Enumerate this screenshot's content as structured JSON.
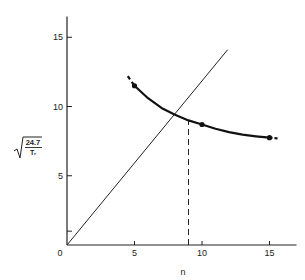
{
  "chart_data": {
    "type": "line",
    "title": "",
    "xlabel": "n",
    "ylabel": "sqrt(24.7 / T_r)",
    "ylabel_parts": {
      "numerator": "24.7",
      "denominator": "Tᵣ"
    },
    "xlim": [
      0,
      17
    ],
    "ylim": [
      0,
      16.5
    ],
    "x_ticks": [
      {
        "value": 0,
        "label": "0"
      },
      {
        "value": 5,
        "label": "5"
      },
      {
        "value": 10,
        "label": "10"
      },
      {
        "value": 15,
        "label": "15"
      }
    ],
    "y_ticks": [
      {
        "value": 1,
        "label": ""
      },
      {
        "value": 5,
        "label": "5"
      },
      {
        "value": 10,
        "label": "10"
      },
      {
        "value": 15,
        "label": "15"
      }
    ],
    "grid": false,
    "legend": null,
    "series": [
      {
        "name": "sqrt(24.7/T_r) curve",
        "style": "thick solid, dashed extensions at ends",
        "markers": true,
        "points": [
          {
            "x": 5,
            "y": 11.5
          },
          {
            "x": 10,
            "y": 8.7
          },
          {
            "x": 15,
            "y": 7.75
          }
        ],
        "curve": [
          {
            "x": 4.5,
            "y": 12.2
          },
          {
            "x": 5,
            "y": 11.5
          },
          {
            "x": 6,
            "y": 10.6
          },
          {
            "x": 7,
            "y": 9.9
          },
          {
            "x": 8,
            "y": 9.4
          },
          {
            "x": 9,
            "y": 9.0
          },
          {
            "x": 10,
            "y": 8.7
          },
          {
            "x": 11,
            "y": 8.4
          },
          {
            "x": 12,
            "y": 8.15
          },
          {
            "x": 13,
            "y": 7.97
          },
          {
            "x": 14,
            "y": 7.85
          },
          {
            "x": 15,
            "y": 7.75
          },
          {
            "x": 15.6,
            "y": 7.7
          }
        ]
      },
      {
        "name": "y = n",
        "style": "thin solid",
        "markers": false,
        "curve": [
          {
            "x": 0,
            "y": 0
          },
          {
            "x": 11.9,
            "y": 14.1
          }
        ]
      }
    ],
    "annotations": [
      {
        "type": "vertical-dashed-line",
        "x": 9,
        "y_from": 0,
        "y_to": 9.0,
        "description": "intersection of curve with y = n"
      }
    ]
  }
}
